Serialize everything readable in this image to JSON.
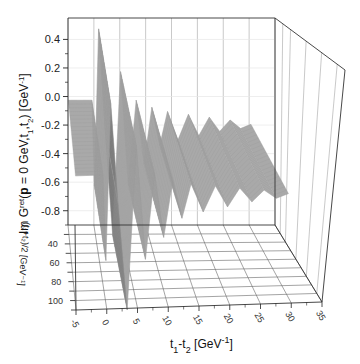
{
  "chart_data": {
    "type": "surface3d",
    "title": "",
    "zlabel": "Im G^ret(p = 0 GeV, t1, t2) [GeV^-1]",
    "zlabel_parts": {
      "main": "Im G",
      "sup": "ret",
      "mid": "(",
      "bold": "p",
      "rest": " = 0 GeV,t",
      "s1": "1",
      "comma": ",t",
      "s2": "2",
      "close": ") [GeV",
      "exp": "-1",
      "end": "]"
    },
    "xlabel": "t1-t2 [GeV^-1]",
    "xlabel_parts": {
      "a": "t",
      "s1": "1",
      "dash": "-t",
      "s2": "2",
      "unit": " [GeV",
      "exp": "-1",
      "end": "]"
    },
    "ylabel": "(t1+t2)/2 [GeV^-1]",
    "ylabel_text": "(t₁+t₂)/2 [GeV⁻¹]",
    "z_ticks": [
      "0.4",
      "0.2",
      "0.0",
      "-0.2",
      "-0.4",
      "-0.6",
      "-0.8"
    ],
    "z_tick_values": [
      0.4,
      0.2,
      0.0,
      -0.2,
      -0.4,
      -0.6,
      -0.8
    ],
    "zlim": [
      -0.9,
      0.55
    ],
    "x_ticks": [
      "-5",
      "0",
      "5",
      "10",
      "15",
      "20",
      "25",
      "30",
      "35"
    ],
    "x_tick_values": [
      -5,
      0,
      5,
      10,
      15,
      20,
      25,
      30,
      35
    ],
    "xlim": [
      -5,
      35
    ],
    "y_ticks": [
      "40",
      "60",
      "80",
      "100"
    ],
    "y_tick_values": [
      40,
      60,
      80,
      100
    ],
    "ylim": [
      20,
      110
    ],
    "surface_profile": {
      "description": "Im G^ret is 0 for t1-t2 < 0, jumps to a damped oscillation for t1-t2 >= 0; independent of (t1+t2)/2",
      "x": [
        -5,
        -0.5,
        0,
        0.8,
        2,
        3.5,
        5,
        6.5,
        8,
        9.5,
        11,
        12.5,
        14,
        16,
        18,
        20,
        22,
        24,
        26,
        28,
        30
      ],
      "z": [
        0.0,
        0.0,
        -0.6,
        0.5,
        -0.2,
        -0.95,
        0.2,
        -0.6,
        0.0,
        -0.45,
        -0.05,
        -0.32,
        -0.08,
        -0.28,
        -0.1,
        -0.25,
        -0.12,
        -0.22,
        -0.14,
        -0.2,
        -0.17
      ]
    },
    "grid": true,
    "surface_color": "#a9a9a9",
    "shadow_color": "#5a5a5a",
    "frame_color": "#333333",
    "grid_color": "#bbbbbb"
  }
}
